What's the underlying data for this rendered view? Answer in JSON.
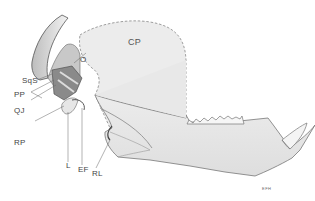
{
  "figure": {
    "labels": {
      "cp": "CP",
      "o": "O",
      "sqs": "SqS",
      "pp": "PP",
      "qj": "QJ",
      "rp": "RP",
      "l": "L",
      "ef": "EF",
      "rl": "RL"
    },
    "signature": "EFH"
  },
  "colors": {
    "bone_fill": "#e9e9e9",
    "bone_shade": "#cfcfcf",
    "outline": "#777777",
    "dark": "#555555",
    "label": "#444444"
  }
}
